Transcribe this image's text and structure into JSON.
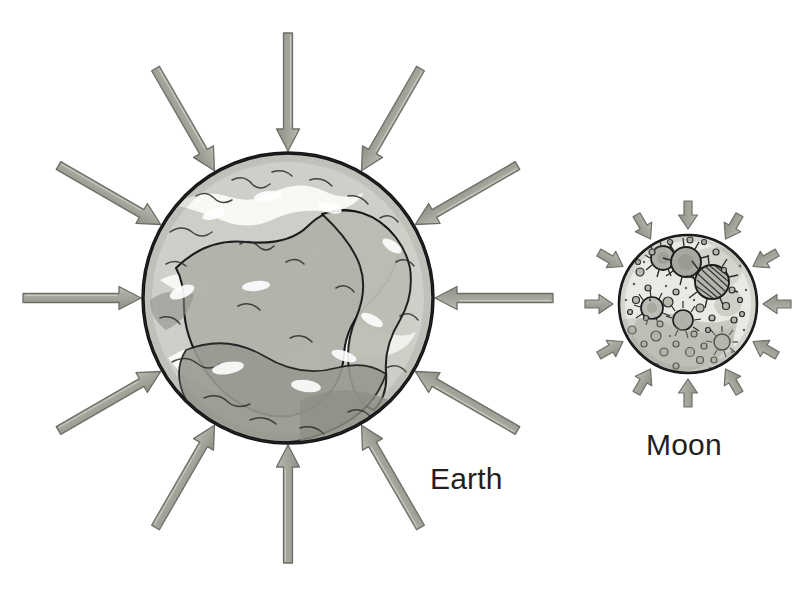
{
  "figure": {
    "type": "diagram",
    "background_color": "#ffffff",
    "width": 812,
    "height": 597
  },
  "labels": {
    "earth": "Earth",
    "moon": "Moon"
  },
  "colors": {
    "arrow_fill": "#a6a69c",
    "arrow_fill_light": "#c2c2ba",
    "arrow_stroke": "#6e6e66",
    "outline": "#1a1a1a",
    "ocean_light": "#d9d9d4",
    "land_mid": "#b0b0a8",
    "land_dark": "#8d8d85",
    "moon_light": "#e6e6e2",
    "moon_mid": "#c9c9c2",
    "moon_dark": "#9a9a92",
    "label_color": "#231f20",
    "white": "#ffffff"
  },
  "bodies": [
    {
      "name": "earth",
      "label": "Earth",
      "center_x": 288,
      "center_y": 298,
      "radius": 146,
      "arrow_count": 12,
      "arrow_length": 118,
      "arrow_shaft_width": 9,
      "arrow_head_width": 23,
      "arrow_head_length": 22,
      "arrow_direction": "inward",
      "arrow_angles_deg": [
        0,
        30,
        60,
        90,
        120,
        150,
        180,
        210,
        240,
        270,
        300,
        330
      ]
    },
    {
      "name": "moon",
      "label": "Moon",
      "center_x": 688,
      "center_y": 304,
      "radius": 70,
      "arrow_count": 12,
      "arrow_length": 28,
      "arrow_shaft_width": 8,
      "arrow_head_width": 19,
      "arrow_head_length": 14,
      "arrow_direction": "inward",
      "arrow_angles_deg": [
        0,
        30,
        60,
        90,
        120,
        150,
        180,
        210,
        240,
        270,
        300,
        330
      ]
    }
  ],
  "earth_features": {
    "continent_paths_count": 6,
    "description": "hand-drawn grayscale globe with continents and cloud patches"
  },
  "moon_features": {
    "crater_count": 42,
    "large_crater_count": 5,
    "description": "hand-drawn grayscale moon with cratered surface"
  }
}
